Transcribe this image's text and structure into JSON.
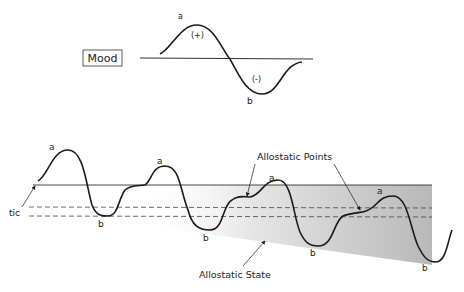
{
  "top_panel": {
    "mood_label": "Mood",
    "peak_label": "a",
    "trough_label": "b",
    "positive_label": "(+)",
    "negative_label": "(-)"
  },
  "bottom_panel": {
    "peak_labels": [
      "a",
      "a",
      "a",
      "a"
    ],
    "trough_labels": [
      "b",
      "b",
      "b",
      "b"
    ],
    "homeostatic_label": "tic",
    "allostatic_points_label": "Allostatic Points",
    "allostatic_state_label": "Allostatic State"
  },
  "colors": {
    "line": "#1a1a1a",
    "shading_dark": "#b8b8b8",
    "shading_light": "#f4f4f4"
  }
}
